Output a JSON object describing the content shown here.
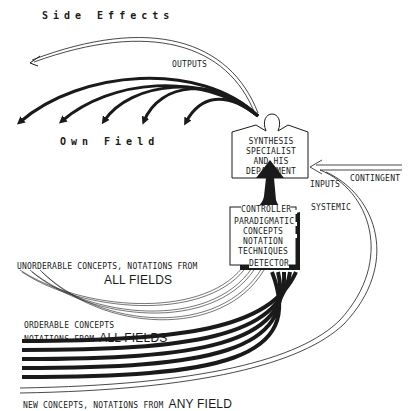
{
  "diagram": {
    "labels": {
      "side_effects": "Side Effects",
      "outputs": "OUTPUTS",
      "own_field": "Own  Field",
      "synthesis_box": [
        "SYNTHESIS",
        "SPECIALIST",
        "AND HIS",
        "DEPARTMENT"
      ],
      "contingent": "CONTINGENT",
      "inputs": "INPUTS",
      "systemic": "SYSTEMIC",
      "controller": "CONTROLLER",
      "paradigmatic_box": [
        "PARADIGMATIC",
        "CONCEPTS",
        "NOTATION",
        "TECHNIQUES"
      ],
      "detector": "DETECTOR",
      "unorderable_line1": "UNORDERABLE CONCEPTS, NOTATIONS FROM",
      "unorderable_line2": "ALL FIELDS",
      "orderable_line1": "ORDERABLE CONCEPTS",
      "orderable_line2a": "NOTATIONS FROM ",
      "orderable_line2b": "ALL FIELDS",
      "new_line_a": "NEW CONCEPTS, NOTATIONS FROM ",
      "new_line_b": "ANY FIELD"
    },
    "colors": {
      "ink": "#1a1a1a",
      "paper": "#ffffff"
    }
  }
}
